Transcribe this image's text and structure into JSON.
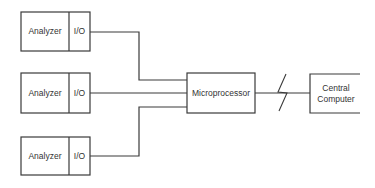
{
  "diagram": {
    "analyzers": [
      {
        "label": "Analyzer",
        "io": "I/O"
      },
      {
        "label": "Analyzer",
        "io": "I/O"
      },
      {
        "label": "Analyzer",
        "io": "I/O"
      }
    ],
    "microprocessor": {
      "label": "Microprocessor"
    },
    "central": {
      "line1": "Central",
      "line2": "Computer"
    },
    "link_symbol": "lightning-bolt (remote communication link)",
    "line_color": "#333333"
  }
}
